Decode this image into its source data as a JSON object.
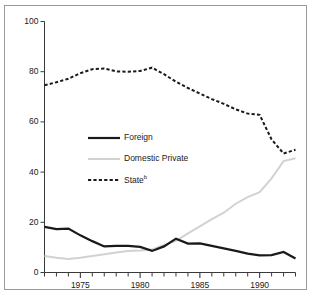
{
  "chart_data": {
    "type": "line",
    "title": "",
    "xlabel": "",
    "ylabel": "",
    "xlim": [
      1972,
      1993
    ],
    "ylim": [
      0,
      100
    ],
    "grid": false,
    "legend_position": "inside-upper-left",
    "y_ticks": [
      "0",
      "20",
      "40",
      "60",
      "80",
      "100"
    ],
    "y_tick_values": [
      0,
      20,
      40,
      60,
      80,
      100
    ],
    "x_ticks": [
      "1975",
      "1980",
      "1985",
      "1990"
    ],
    "x_tick_values": [
      1975,
      1980,
      1985,
      1990
    ],
    "x_minor_tick_values": [
      1972,
      1973,
      1974,
      1975,
      1976,
      1977,
      1978,
      1979,
      1980,
      1981,
      1982,
      1983,
      1984,
      1985,
      1986,
      1987,
      1988,
      1989,
      1990,
      1991,
      1992,
      1993
    ],
    "x": [
      1972,
      1973,
      1974,
      1975,
      1976,
      1977,
      1978,
      1979,
      1980,
      1981,
      1982,
      1983,
      1984,
      1985,
      1986,
      1987,
      1988,
      1989,
      1990,
      1991,
      1992,
      1993
    ],
    "series": [
      {
        "name": "Foreign",
        "style": "solid-thick",
        "color": "#1a1a1a",
        "values": [
          18.2,
          17.3,
          17.5,
          14.8,
          12.5,
          10.4,
          10.6,
          10.6,
          10.2,
          8.6,
          10.4,
          13.5,
          11.5,
          11.6,
          10.6,
          9.6,
          8.6,
          7.5,
          6.8,
          6.9,
          8.2,
          5.6
        ]
      },
      {
        "name": "Domestic Private",
        "style": "solid-thin",
        "color": "#d2d2d2",
        "values": [
          6.6,
          5.9,
          5.4,
          5.9,
          6.6,
          7.3,
          8.0,
          8.6,
          8.8,
          9.2,
          11.0,
          12.6,
          15.6,
          18.4,
          21.3,
          23.8,
          27.4,
          30.0,
          32.0,
          37.5,
          44.4,
          45.5
        ]
      },
      {
        "name": "State",
        "label_superscript": "b",
        "style": "dashed",
        "color": "#1a1a1a",
        "values": [
          74.6,
          75.8,
          77.2,
          79.4,
          81.0,
          81.3,
          80.1,
          80.0,
          80.3,
          81.6,
          79.0,
          76.0,
          73.5,
          71.3,
          69.1,
          67.2,
          65.0,
          63.3,
          62.8,
          53.0,
          47.4,
          48.9
        ]
      }
    ],
    "legend": [
      {
        "label": "Foreign",
        "style": "solid-thick",
        "color": "#1a1a1a"
      },
      {
        "label": "Domestic Private",
        "style": "solid-thin",
        "color": "#d2d2d2"
      },
      {
        "label": "State",
        "superscript": "b",
        "style": "dashed",
        "color": "#1a1a1a"
      }
    ]
  },
  "caption": {
    "text": ""
  }
}
